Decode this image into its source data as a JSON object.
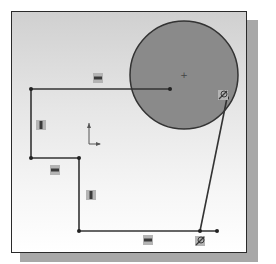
{
  "figure": {
    "caption": ""
  },
  "colors": {
    "frame_border": "#2a2a2a",
    "shadow": "#a8a8a8",
    "circle_fill": "#8a8a8a",
    "circle_stroke": "#333333",
    "line": "#333333",
    "relation_badge_bg": "#b4b4b4",
    "relation_badge_fg": "#3a3a3a"
  },
  "sketch": {
    "circle": {
      "cx": 184,
      "cy": 75,
      "r": 54,
      "center_mark": "+"
    },
    "points": {
      "A": [
        31,
        89
      ],
      "B": [
        170,
        89
      ],
      "C": [
        31,
        158
      ],
      "D": [
        79,
        158
      ],
      "E": [
        79,
        231
      ],
      "F": [
        200,
        231
      ],
      "G": [
        217,
        231
      ],
      "T": [
        227,
        98
      ]
    },
    "lines": [
      {
        "from": "A",
        "to": "B",
        "relation": "horizontal"
      },
      {
        "from": "A",
        "to": "C",
        "relation": "vertical"
      },
      {
        "from": "C",
        "to": "D",
        "relation": "horizontal"
      },
      {
        "from": "D",
        "to": "E",
        "relation": "vertical"
      },
      {
        "from": "E",
        "to": "G",
        "relation": "horizontal"
      },
      {
        "from": "F",
        "to": "T",
        "relation": "tangent"
      }
    ],
    "relation_icons": [
      {
        "type": "horizontal",
        "x": 98,
        "y": 78
      },
      {
        "type": "vertical",
        "x": 41,
        "y": 125
      },
      {
        "type": "horizontal",
        "x": 55,
        "y": 170
      },
      {
        "type": "vertical",
        "x": 91,
        "y": 195
      },
      {
        "type": "horizontal",
        "x": 148,
        "y": 240
      },
      {
        "type": "tangent",
        "x": 223,
        "y": 95
      },
      {
        "type": "tangent",
        "x": 200,
        "y": 241
      }
    ],
    "origin_axes": {
      "x": 89,
      "y": 144,
      "up_len": 21,
      "right_len": 11
    }
  }
}
